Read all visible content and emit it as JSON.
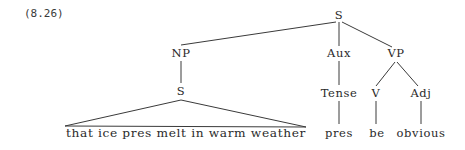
{
  "example_number": "(8.26)",
  "tree": {
    "root": "S",
    "nodes": {
      "s_root": "S",
      "np": "NP",
      "aux": "Aux",
      "vp": "VP",
      "s_embedded": "S",
      "tense": "Tense",
      "v": "V",
      "adj": "Adj"
    },
    "leaves": {
      "embedded_clause": "that ice pres melt in warm weather",
      "tense_value": "pres",
      "verb": "be",
      "adjective": "obvious"
    },
    "structure": [
      {
        "parent": "S",
        "children": [
          "NP",
          "Aux",
          "VP"
        ]
      },
      {
        "parent": "NP",
        "children": [
          "S"
        ]
      },
      {
        "parent": "S (embedded)",
        "children": [
          "that ice pres melt in warm weather"
        ],
        "triangle": true
      },
      {
        "parent": "Aux",
        "children": [
          "Tense"
        ]
      },
      {
        "parent": "Tense",
        "children": [
          "pres"
        ]
      },
      {
        "parent": "VP",
        "children": [
          "V",
          "Adj"
        ]
      },
      {
        "parent": "V",
        "children": [
          "be"
        ]
      },
      {
        "parent": "Adj",
        "children": [
          "obvious"
        ]
      }
    ]
  }
}
